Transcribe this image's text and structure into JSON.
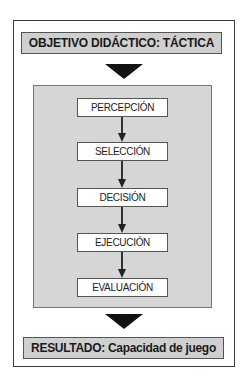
{
  "diagram": {
    "header": "OBJETIVO DIDÁCTICO: TÁCTICA",
    "steps": [
      {
        "label": "PERCEPCIÓN"
      },
      {
        "label": "SELECCIÓN"
      },
      {
        "label": "DECISIÓN"
      },
      {
        "label": "EJECUCIÓN"
      },
      {
        "label": "EVALUACIÓN"
      }
    ],
    "result": "RESULTADO: Capacidad de juego",
    "colors": {
      "header_fill": "#cfcfcf",
      "panel_fill": "#d6d6d6",
      "step_fill": "#ffffff",
      "arrow": "#111111"
    }
  }
}
